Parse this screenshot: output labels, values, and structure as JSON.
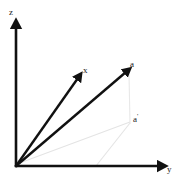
{
  "figure": {
    "background_color": "#ffffff",
    "axis_color": "#111111",
    "vector_color": "#111111",
    "guide_color": "#e2e2e2",
    "label_color": "#1a1a1a"
  },
  "axes": [
    {
      "name": "z-axis",
      "label": "z",
      "label_x": 9,
      "label_y": 8,
      "from": [
        16,
        166
      ],
      "to": [
        16,
        24
      ],
      "arrow": true
    },
    {
      "name": "y-axis",
      "label": "y",
      "label_x": 167,
      "label_y": 165,
      "from": [
        16,
        166
      ],
      "to": [
        163,
        166
      ],
      "arrow": true
    }
  ],
  "vectors": [
    {
      "name": "vector-x",
      "label": "x",
      "label_x": 83,
      "label_y": 66,
      "from": [
        16,
        166
      ],
      "to": [
        80,
        76
      ],
      "arrow": true,
      "stroke_width": 2.4
    },
    {
      "name": "vector-a",
      "label": "a",
      "label_x": 130,
      "label_y": 60,
      "from": [
        16,
        166
      ],
      "to": [
        128,
        70
      ],
      "arrow": true,
      "stroke_width": 2.4
    }
  ],
  "projection": {
    "name": "projection-a-prime",
    "label": "a",
    "prime": "'",
    "label_x": 133,
    "label_y": 113,
    "point": [
      130,
      122
    ],
    "drop_line_from": [
      129,
      74
    ],
    "drop_line_to": [
      130,
      124
    ]
  },
  "guide_lines": [
    {
      "name": "guide-origin-to-aprime",
      "from": [
        17,
        164
      ],
      "to": [
        130,
        122
      ]
    },
    {
      "name": "guide-aprime-to-y-axis",
      "from": [
        130,
        123
      ],
      "to": [
        96,
        166
      ]
    },
    {
      "name": "guide-origin-to-base",
      "from": [
        17,
        165
      ],
      "to": [
        97,
        166
      ]
    },
    {
      "name": "guide-aprime-vertical",
      "from": [
        129,
        74
      ],
      "to": [
        130,
        124
      ]
    }
  ],
  "labels": {
    "z": "z",
    "y": "y",
    "x": "x",
    "a": "a",
    "a_prime_base": "a",
    "a_prime_mark": "'"
  }
}
